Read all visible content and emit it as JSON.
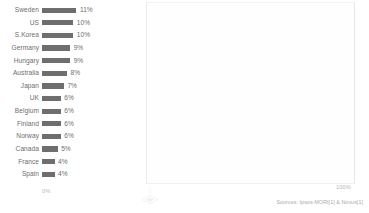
{
  "chart_data": {
    "type": "bar",
    "orientation": "horizontal",
    "title": "",
    "xlabel": "",
    "ylabel": "",
    "xlim": [
      0,
      100
    ],
    "grid": false,
    "legend": null,
    "categories": [
      "Sweden",
      "US",
      "S.Korea",
      "Germany",
      "Hungary",
      "Australia",
      "Japan",
      "UK",
      "Belgium",
      "Finland",
      "Norway",
      "Canada",
      "France",
      "Spain"
    ],
    "values": [
      11,
      10,
      10,
      9,
      9,
      8,
      7,
      6,
      6,
      6,
      6,
      5,
      4,
      4
    ],
    "value_labels": [
      "11%",
      "10%",
      "10%",
      "9%",
      "9%",
      "8%",
      "7%",
      "6%",
      "6%",
      "6%",
      "6%",
      "5%",
      "4%",
      "4%"
    ],
    "bar_color": "#6e6e6e",
    "axis_ticks": {
      "left": "0%",
      "right": "100%"
    }
  },
  "footer": {
    "source": "Sources: Ipsos-MORI[1] & Novus[1]"
  },
  "watermark": {
    "name": "diamond-watermark"
  }
}
